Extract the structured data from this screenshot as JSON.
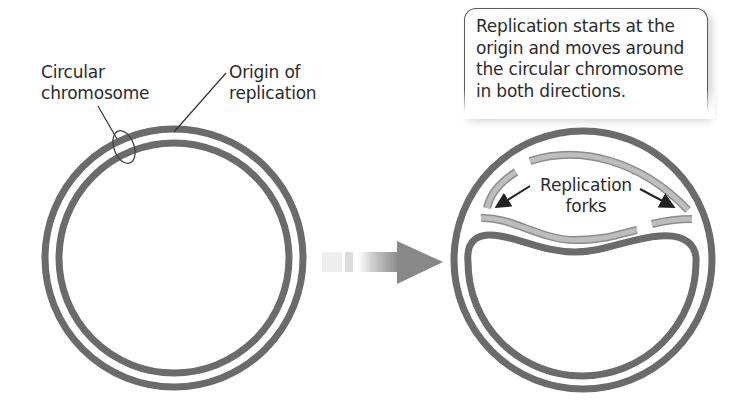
{
  "diagram": {
    "left_panel": {
      "labels": {
        "circular_chromosome_line1": "Circular",
        "circular_chromosome_line2": "chromosome",
        "origin_line1": "Origin of",
        "origin_line2": "replication"
      }
    },
    "transition_arrow": {
      "direction": "right"
    },
    "right_panel": {
      "callout": {
        "line1": "Replication starts at the",
        "line2": "origin and moves around",
        "line3": "the circular chromosome",
        "line4": "in both directions."
      },
      "forks_label": {
        "line1": "Replication",
        "line2": "forks"
      }
    },
    "colors": {
      "parent_strand": "#6b6b6b",
      "new_strand": "#b4b4b4",
      "text": "#2b2b2b",
      "background": "#ffffff"
    }
  }
}
